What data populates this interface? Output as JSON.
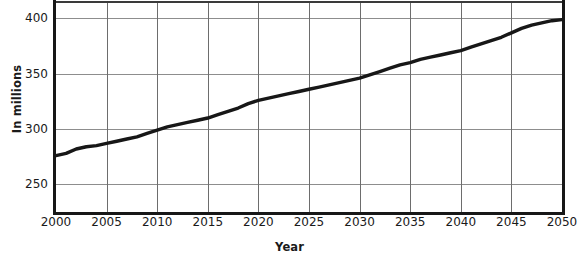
{
  "chart_data": {
    "type": "line",
    "title": "",
    "xlabel": "Year",
    "ylabel": "In millions",
    "xlim": [
      2000,
      2050
    ],
    "ylim": [
      225,
      414
    ],
    "grid": true,
    "legend": false,
    "xticks": [
      2000,
      2005,
      2010,
      2015,
      2020,
      2025,
      2030,
      2035,
      2040,
      2045,
      2050
    ],
    "xtick_labels": [
      "2000",
      "2005",
      "2010",
      "2015",
      "2020",
      "2025",
      "2030",
      "2035",
      "2040",
      "2045",
      "2050"
    ],
    "yticks": [
      250,
      300,
      350,
      400
    ],
    "ytick_labels": [
      "250",
      "300",
      "350",
      "400"
    ],
    "line_color": "#171717",
    "series": [
      {
        "name": "Population",
        "x": [
          2000,
          2001,
          2002,
          2003,
          2004,
          2005,
          2006,
          2007,
          2008,
          2009,
          2010,
          2011,
          2012,
          2013,
          2014,
          2015,
          2016,
          2017,
          2018,
          2019,
          2020,
          2021,
          2022,
          2023,
          2024,
          2025,
          2026,
          2027,
          2028,
          2029,
          2030,
          2031,
          2032,
          2033,
          2034,
          2035,
          2036,
          2037,
          2038,
          2039,
          2040,
          2041,
          2042,
          2043,
          2044,
          2045,
          2046,
          2047,
          2048,
          2049,
          2050
        ],
        "values": [
          276,
          278,
          282,
          284,
          285,
          287,
          289,
          291,
          293,
          296,
          299,
          302,
          304,
          306,
          308,
          310,
          313,
          316,
          319,
          323,
          326,
          328,
          330,
          332,
          334,
          336,
          338,
          340,
          342,
          344,
          346,
          349,
          352,
          355,
          358,
          360,
          363,
          365,
          367,
          369,
          371,
          374,
          377,
          380,
          383,
          387,
          391,
          394,
          396,
          398,
          399
        ]
      }
    ]
  }
}
